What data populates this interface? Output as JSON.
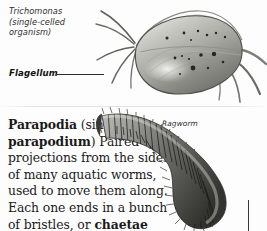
{
  "page": {
    "background_color": "#fdfdfd",
    "text_color": "#1a1a1a"
  },
  "panels": [
    {
      "id": "trichomonas",
      "figure_caption": "Trichomonas\n(single-celled\norganism)",
      "part_label": "Flagellum",
      "illustration_name": "trichomonas-cell-illustration",
      "illustration_colors": {
        "body_light": "#cfcfcb",
        "body_mid": "#9a9a96",
        "body_dark": "#6d6d69",
        "outline": "#4a4a47",
        "granule": "#2a2a28"
      }
    },
    {
      "id": "parapodia",
      "term": "Parapodia",
      "singular_note": "(sing.",
      "singular_form": "parapodium",
      "singular_close": ")",
      "definition_body": "Paired projections from the sides of many aquatic worms, used to move them along. Each one ends in a bunch of bristles, or ",
      "definition_bold_tail": "chaetae",
      "figure_caption": "Ragworm",
      "illustration_name": "ragworm-illustration",
      "illustration_colors": {
        "body_dark": "#3b3b39",
        "body_mid": "#6e6e6a",
        "body_light": "#b9b9b5",
        "bristle": "#2c2c2a"
      }
    }
  ]
}
